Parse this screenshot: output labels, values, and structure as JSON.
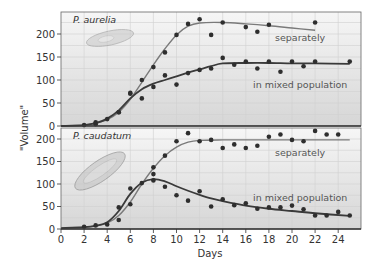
{
  "chart_data": [
    {
      "type": "scatter",
      "panel": "top",
      "title": "P. aurelia",
      "xlabel": "Days",
      "ylabel": "\"Volume\"",
      "xlim": [
        0,
        26
      ],
      "ylim": [
        0,
        250
      ],
      "x_ticks": [
        0,
        2,
        4,
        6,
        8,
        10,
        12,
        14,
        16,
        18,
        20,
        22,
        24
      ],
      "y_ticks": [
        0,
        50,
        100,
        150,
        200
      ],
      "grid": true,
      "series": [
        {
          "name": "separately",
          "color": "#7a7a7a",
          "points": [
            [
              2,
              2
            ],
            [
              3,
              8
            ],
            [
              3,
              4
            ],
            [
              4,
              15
            ],
            [
              5,
              30
            ],
            [
              6,
              72
            ],
            [
              7,
              100
            ],
            [
              8,
              128
            ],
            [
              9,
              160
            ],
            [
              10,
              198
            ],
            [
              11,
              222
            ],
            [
              12,
              232
            ],
            [
              13,
              198
            ],
            [
              14,
              225
            ],
            [
              16,
              215
            ],
            [
              17,
              205
            ],
            [
              18,
              220
            ],
            [
              22,
              225
            ]
          ],
          "curve": [
            [
              0,
              0
            ],
            [
              2,
              2
            ],
            [
              3,
              6
            ],
            [
              4,
              14
            ],
            [
              5,
              30
            ],
            [
              6,
              58
            ],
            [
              7,
              95
            ],
            [
              8,
              133
            ],
            [
              9,
              168
            ],
            [
              10,
              198
            ],
            [
              11,
              217
            ],
            [
              12,
              224
            ],
            [
              14,
              225
            ],
            [
              16,
              222
            ],
            [
              18,
              218
            ],
            [
              20,
              213
            ],
            [
              22,
              208
            ]
          ]
        },
        {
          "name": "in mixed population",
          "color": "#3a3a3a",
          "points": [
            [
              5,
              30
            ],
            [
              6,
              70
            ],
            [
              7,
              60
            ],
            [
              8,
              85
            ],
            [
              9,
              110
            ],
            [
              10,
              90
            ],
            [
              11,
              115
            ],
            [
              12,
              122
            ],
            [
              13,
              125
            ],
            [
              14,
              148
            ],
            [
              15,
              133
            ],
            [
              16,
              140
            ],
            [
              17,
              125
            ],
            [
              18,
              140
            ],
            [
              19,
              118
            ],
            [
              20,
              140
            ],
            [
              21,
              130
            ],
            [
              22,
              140
            ],
            [
              25,
              140
            ]
          ],
          "curve": [
            [
              0,
              0
            ],
            [
              2,
              2
            ],
            [
              3,
              6
            ],
            [
              4,
              16
            ],
            [
              5,
              34
            ],
            [
              6,
              60
            ],
            [
              7,
              80
            ],
            [
              8,
              92
            ],
            [
              9,
              100
            ],
            [
              10,
              108
            ],
            [
              11,
              116
            ],
            [
              12,
              123
            ],
            [
              13,
              130
            ],
            [
              14,
              136
            ],
            [
              16,
              137
            ],
            [
              18,
              137
            ],
            [
              20,
              136
            ],
            [
              22,
              136
            ],
            [
              25,
              135
            ]
          ]
        }
      ]
    },
    {
      "type": "scatter",
      "panel": "bottom",
      "title": "P. caudatum",
      "xlabel": "Days",
      "ylabel": "\"Volume\"",
      "xlim": [
        0,
        26
      ],
      "ylim": [
        0,
        210
      ],
      "x_ticks": [
        0,
        2,
        4,
        6,
        8,
        10,
        12,
        14,
        16,
        18,
        20,
        22,
        24
      ],
      "y_ticks": [
        0,
        50,
        100,
        150,
        200
      ],
      "grid": true,
      "series": [
        {
          "name": "separately",
          "color": "#7a7a7a",
          "points": [
            [
              2,
              5
            ],
            [
              3,
              8
            ],
            [
              4,
              10
            ],
            [
              5,
              20
            ],
            [
              6,
              55
            ],
            [
              8,
              122
            ],
            [
              8,
              137
            ],
            [
              9,
              163
            ],
            [
              10,
              195
            ],
            [
              11,
              213
            ],
            [
              12,
              195
            ],
            [
              13,
              198
            ],
            [
              14,
              180
            ],
            [
              15,
              188
            ],
            [
              16,
              180
            ],
            [
              17,
              185
            ],
            [
              18,
              205
            ],
            [
              19,
              210
            ],
            [
              20,
              198
            ],
            [
              21,
              195
            ],
            [
              22,
              218
            ],
            [
              23,
              210
            ],
            [
              24,
              210
            ]
          ],
          "curve": [
            [
              0,
              2
            ],
            [
              2,
              4
            ],
            [
              3,
              7
            ],
            [
              4,
              13
            ],
            [
              5,
              30
            ],
            [
              6,
              60
            ],
            [
              7,
              100
            ],
            [
              8,
              135
            ],
            [
              9,
              163
            ],
            [
              10,
              182
            ],
            [
              11,
              193
            ],
            [
              12,
              197
            ],
            [
              14,
              198
            ],
            [
              16,
              198
            ],
            [
              18,
              198
            ],
            [
              20,
              198
            ],
            [
              22,
              198
            ],
            [
              25,
              198
            ]
          ]
        },
        {
          "name": "in mixed population",
          "color": "#3a3a3a",
          "points": [
            [
              5,
              48
            ],
            [
              6,
              90
            ],
            [
              7,
              102
            ],
            [
              8,
              108
            ],
            [
              9,
              94
            ],
            [
              10,
              75
            ],
            [
              11,
              63
            ],
            [
              12,
              84
            ],
            [
              13,
              50
            ],
            [
              14,
              66
            ],
            [
              15,
              53
            ],
            [
              16,
              57
            ],
            [
              17,
              45
            ],
            [
              18,
              48
            ],
            [
              19,
              48
            ],
            [
              20,
              52
            ],
            [
              21,
              44
            ],
            [
              22,
              30
            ],
            [
              23,
              30
            ],
            [
              24,
              38
            ],
            [
              25,
              30
            ]
          ],
          "curve": [
            [
              0,
              2
            ],
            [
              2,
              4
            ],
            [
              3,
              7
            ],
            [
              4,
              15
            ],
            [
              5,
              40
            ],
            [
              6,
              78
            ],
            [
              7,
              103
            ],
            [
              8,
              111
            ],
            [
              9,
              106
            ],
            [
              10,
              95
            ],
            [
              11,
              85
            ],
            [
              12,
              76
            ],
            [
              13,
              68
            ],
            [
              14,
              62
            ],
            [
              16,
              52
            ],
            [
              18,
              45
            ],
            [
              20,
              40
            ],
            [
              22,
              35
            ],
            [
              25,
              29
            ]
          ]
        }
      ]
    }
  ],
  "labels": {
    "top_species": "P. aurelia",
    "bottom_species": "P. caudatum",
    "separately": "separately",
    "mixed": "in mixed population",
    "ylabel": "\"Volume\"",
    "xlabel": "Days"
  },
  "colors": {
    "separately_line": "#7a7a7a",
    "mixed_line": "#3a3a3a",
    "dot": "#2e2e2e",
    "grid": "#d0d0d0",
    "panel_top_bg": "#f4f4f4",
    "panel_bottom_bg": "#d9d9d9",
    "frame": "#555555"
  }
}
